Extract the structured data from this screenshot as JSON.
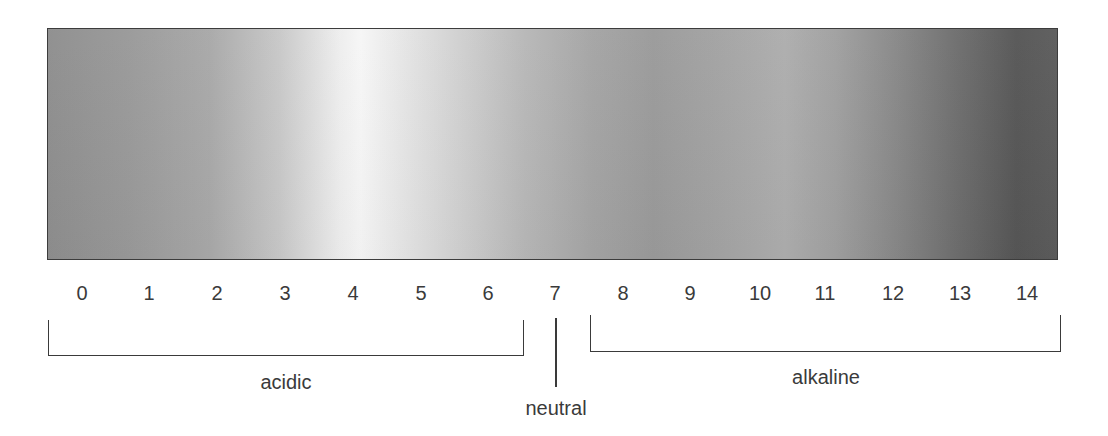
{
  "diagram": {
    "bar": {
      "gradient_stops": [
        {
          "pos": 0,
          "color": "#8e8e8e"
        },
        {
          "pos": 0.16,
          "color": "#a8a8a8"
        },
        {
          "pos": 0.3,
          "color": "#f6f6f6"
        },
        {
          "pos": 0.47,
          "color": "#b8b8b8"
        },
        {
          "pos": 0.6,
          "color": "#9a9a9a"
        },
        {
          "pos": 0.73,
          "color": "#adadad"
        },
        {
          "pos": 0.84,
          "color": "#888888"
        },
        {
          "pos": 0.96,
          "color": "#565656"
        },
        {
          "pos": 1.0,
          "color": "#5c5c5c"
        }
      ],
      "border_color": "#3c3c3c"
    },
    "scale": {
      "ticks": [
        "0",
        "1",
        "2",
        "3",
        "4",
        "5",
        "6",
        "7",
        "8",
        "9",
        "10",
        "11",
        "12",
        "13",
        "14"
      ]
    },
    "ranges": {
      "acidic": {
        "label": "acidic",
        "from": "0",
        "to": "6"
      },
      "neutral": {
        "label": "neutral",
        "at": "7"
      },
      "alkaline": {
        "label": "alkaline",
        "from": "8",
        "to": "14"
      }
    },
    "text_color": "#3a3a3a"
  }
}
